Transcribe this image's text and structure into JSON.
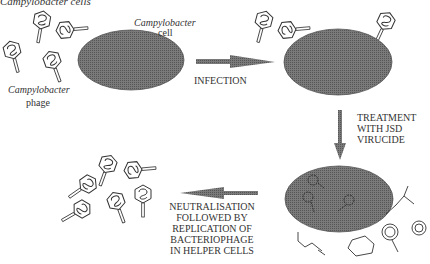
{
  "labels": {
    "title_cells": "Campylobacter cells",
    "cell": "Campylobacter",
    "cell_line2": "cell",
    "phage": "Campylobacter",
    "phage_line2": "phage",
    "infection": "INFECTION",
    "treatment": [
      "TREATMENT",
      "WITH JSD",
      "VIRUCIDE"
    ],
    "neutralisation": [
      "NEUTRALISATION",
      "FOLLOWED BY",
      "REPLICATION OF",
      "BACTERIOPHAGE",
      "IN HELPER CELLS"
    ]
  },
  "colors": {
    "cell_fill": "#6e6e6e",
    "arrow_fill": "#8a8a8a",
    "line": "#333333"
  }
}
